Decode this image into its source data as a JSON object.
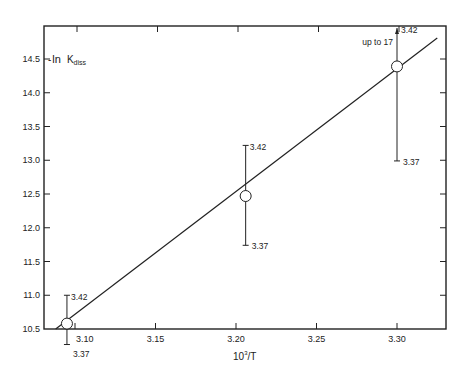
{
  "chart_data": {
    "type": "scatter",
    "title": "",
    "xlabel": "10³/T",
    "xlabel_base": "10",
    "xlabel_sup": "3",
    "xlabel_rest": "/T",
    "ylabel": "-ln K_diss",
    "ylabel_prefix": "-",
    "ylabel_ln": "ln",
    "ylabel_k": "K",
    "ylabel_sub": "diss",
    "xlim": [
      3.085,
      3.33
    ],
    "ylim": [
      10.5,
      15.0
    ],
    "x_ticks": [
      3.1,
      3.15,
      3.2,
      3.25,
      3.3
    ],
    "x_tick_labels": [
      "3.10",
      "3.15",
      "3.20",
      "3.25",
      "3.30"
    ],
    "y_ticks": [
      10.5,
      11.0,
      11.5,
      12.0,
      12.5,
      13.0,
      13.5,
      14.0,
      14.5
    ],
    "y_tick_labels": [
      "10.5",
      "11.0",
      "11.5",
      "12.0",
      "12.5",
      "13.0",
      "13.5",
      "14.0",
      "14.5"
    ],
    "grid": false,
    "legend": null,
    "points": [
      {
        "x": 3.095,
        "y": 10.58,
        "err_low": 10.27,
        "err_high": 11.0,
        "label_high": "3.42",
        "label_low": "3.37"
      },
      {
        "x": 3.206,
        "y": 12.47,
        "err_low": 11.74,
        "err_high": 13.22,
        "label_high": "3.42",
        "label_low": "3.37"
      },
      {
        "x": 3.3,
        "y": 14.39,
        "err_low": 12.99,
        "err_high": 15.0,
        "label_high": "3.42",
        "label_low": "3.37",
        "note": "up to 17"
      }
    ],
    "fit_line": {
      "x": [
        3.088,
        3.325
      ],
      "y": [
        10.5,
        14.81
      ]
    },
    "annotations": [
      "up to 17",
      "3.42",
      "3.37"
    ]
  }
}
